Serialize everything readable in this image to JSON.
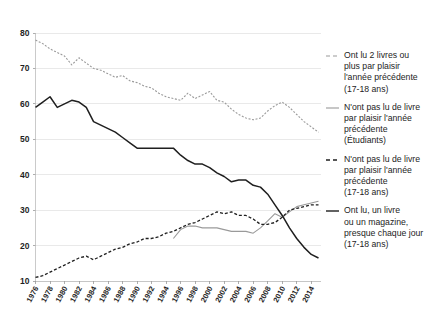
{
  "chart_data": {
    "type": "line",
    "title": "",
    "xlabel": "",
    "ylabel": "",
    "xlim": [
      1976,
      2015
    ],
    "ylim": [
      10,
      80
    ],
    "yticks": [
      10,
      20,
      30,
      40,
      50,
      60,
      70,
      80
    ],
    "xticks": [
      1976,
      1978,
      1980,
      1982,
      1984,
      1986,
      1988,
      1990,
      1992,
      1994,
      1996,
      1998,
      2000,
      2002,
      2004,
      2006,
      2008,
      2010,
      2012,
      2014
    ],
    "grid": "horizontal",
    "legend_position": "right",
    "x": [
      1976,
      1977,
      1978,
      1979,
      1980,
      1981,
      1982,
      1983,
      1984,
      1985,
      1986,
      1987,
      1988,
      1989,
      1990,
      1991,
      1992,
      1993,
      1994,
      1995,
      1996,
      1997,
      1998,
      1999,
      2000,
      2001,
      2002,
      2003,
      2004,
      2005,
      2006,
      2007,
      2008,
      2009,
      2010,
      2011,
      2012,
      2013,
      2014,
      2015
    ],
    "series": [
      {
        "name": "Ont lu 2 livres ou plus par plaisir l'année précédente (17-18 ans)",
        "key": "lu-2-livres-ou-plus",
        "style": "dashed",
        "color": "#9a9a9a",
        "width": 1.1,
        "values": [
          78.0,
          77.0,
          75.5,
          74.5,
          73.5,
          71.0,
          73.0,
          71.5,
          70.0,
          69.5,
          68.5,
          67.5,
          68.0,
          66.5,
          66.0,
          65.0,
          64.5,
          63.0,
          62.0,
          61.5,
          61.0,
          63.0,
          61.5,
          62.5,
          63.5,
          61.0,
          60.5,
          58.5,
          57.0,
          56.0,
          55.5,
          56.0,
          58.0,
          59.5,
          60.5,
          59.0,
          57.0,
          55.0,
          53.5,
          52.0
        ]
      },
      {
        "name": "N'ont pas lu de livre par plaisir l'année précédente (Étudiants)",
        "key": "pas-lu-etudiants",
        "style": "solid",
        "color": "#9a9a9a",
        "width": 1.1,
        "values": [
          null,
          null,
          null,
          null,
          null,
          null,
          null,
          null,
          null,
          null,
          null,
          null,
          null,
          null,
          null,
          null,
          null,
          null,
          null,
          22.0,
          24.5,
          25.5,
          25.5,
          25.0,
          25.0,
          25.0,
          24.5,
          24.0,
          24.0,
          24.0,
          23.5,
          25.0,
          27.0,
          29.0,
          28.0,
          29.5,
          31.0,
          31.5,
          32.0,
          32.5
        ]
      },
      {
        "name": "N'ont pas lu de livre par plaisir l'année précédente (17-18 ans)",
        "key": "pas-lu-17-18",
        "style": "dashed",
        "color": "#1f1f1f",
        "width": 1.3,
        "values": [
          11.0,
          11.5,
          12.5,
          13.5,
          14.5,
          15.5,
          16.5,
          17.0,
          16.0,
          17.0,
          18.0,
          19.0,
          19.5,
          20.5,
          21.0,
          22.0,
          22.0,
          22.5,
          23.5,
          24.0,
          25.0,
          26.0,
          26.5,
          27.5,
          28.5,
          29.5,
          29.0,
          29.5,
          28.5,
          28.5,
          27.5,
          26.0,
          26.0,
          26.5,
          28.0,
          30.0,
          30.5,
          31.0,
          31.5,
          31.5
        ]
      },
      {
        "name": "Ont lu, un livre ou un magazine, presque chaque jour (17-18 ans)",
        "key": "lu-presque-chaque-jour",
        "style": "solid",
        "color": "#1f1f1f",
        "width": 1.5,
        "values": [
          59.0,
          60.5,
          62.0,
          59.0,
          60.0,
          61.0,
          60.5,
          59.0,
          55.0,
          54.0,
          53.0,
          52.0,
          50.5,
          49.0,
          47.5,
          47.5,
          47.5,
          47.5,
          47.5,
          47.5,
          45.5,
          44.0,
          43.0,
          43.0,
          42.0,
          40.5,
          39.5,
          38.0,
          38.5,
          38.5,
          37.0,
          36.5,
          34.5,
          31.5,
          28.5,
          25.0,
          22.0,
          19.5,
          17.5,
          16.5
        ]
      }
    ],
    "legend": [
      {
        "label": "Ont lu 2 livres ou\nplus par plaisir\nl'année précédente\n(17-18 ans)",
        "style": "dashed",
        "color": "#9a9a9a"
      },
      {
        "label": "N'ont pas lu de livre\npar plaisir l'année\nprécédente\n(Étudiants)",
        "style": "solid",
        "color": "#9a9a9a"
      },
      {
        "label": "N'ont pas lu de livre\npar plaisir l'année\nprécédente\n(17-18 ans)",
        "style": "dashed",
        "color": "#1f1f1f"
      },
      {
        "label": "Ont lu, un livre\nou un magazine,\npresque chaque jour\n(17-18 ans)",
        "style": "solid",
        "color": "#1f1f1f"
      }
    ]
  },
  "colors": {
    "grid": "#e3e3e3",
    "axis": "#bdbdbd",
    "text": "#242424",
    "light_series": "#9a9a9a",
    "dark_series": "#1f1f1f",
    "background": "#ffffff"
  }
}
